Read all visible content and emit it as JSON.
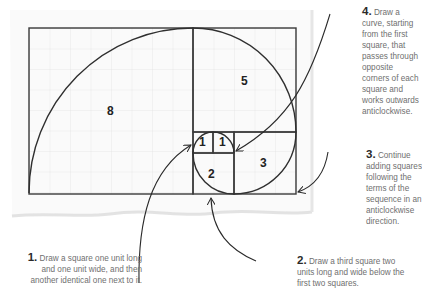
{
  "diagram": {
    "squares": [
      {
        "label": "8",
        "x": 0,
        "y": 0,
        "size": 8
      },
      {
        "label": "5",
        "x": 8,
        "y": 0,
        "size": 5
      },
      {
        "label": "3",
        "x": 10,
        "y": 5,
        "size": 3
      },
      {
        "label": "2",
        "x": 8,
        "y": 6,
        "size": 2
      },
      {
        "label": "1",
        "x": 8,
        "y": 5,
        "size": 1
      },
      {
        "label": "1",
        "x": 9,
        "y": 5,
        "size": 1
      }
    ],
    "colors": {
      "line": "#3a3a3a",
      "grid": "#e2e2e2",
      "paper_shadow": "#dcdcdc",
      "text": "#6f6f6f",
      "number": "#2a2a2a"
    }
  },
  "steps": [
    {
      "num": "1.",
      "text": "Draw a square one unit long and one unit wide, and then another identical one next to it."
    },
    {
      "num": "2.",
      "text": "Draw a third square two units long and wide below the first two squares."
    },
    {
      "num": "3.",
      "text": "Continue adding squares following the terms of the sequence in an anticlockwise direction."
    },
    {
      "num": "4.",
      "text": "Draw a curve, starting from the first square, that passes through opposite corners of each square and works outwards anticlockwise."
    }
  ]
}
